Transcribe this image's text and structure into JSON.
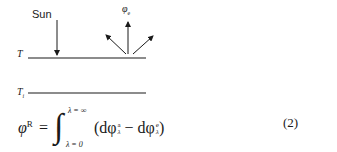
{
  "figure": {
    "sun_label": "Sun",
    "top_surface_label": "T",
    "inner_surface_label": "T",
    "inner_surface_subscript": "i",
    "emitted_label": "φ",
    "emitted_subscript": "e"
  },
  "equation": {
    "lhs": "φ",
    "lhs_superscript": "R",
    "equals": "=",
    "integral_sign": "∫",
    "upper_limit": "λ = ∞",
    "lower_limit": "λ = 0",
    "open_paren": "(dφ",
    "term1_superscript": "a",
    "term1_subscript": "λ",
    "minus": " − dφ",
    "term2_superscript": "e",
    "term2_subscript": "λ",
    "close_paren": ")",
    "number": "(2)"
  }
}
